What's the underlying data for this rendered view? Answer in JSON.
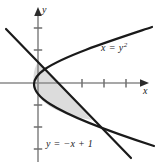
{
  "figure": {
    "background_color": "#ffffff",
    "width": 156,
    "height": 162
  },
  "axes": {
    "x_axis": {
      "label": "x",
      "color": "#7d7d7d",
      "origin_px": 38,
      "y_px": 83,
      "arrow": "right",
      "tick_spacing_px": 22,
      "ticks_right": 3,
      "tick_positions_px": [
        82,
        104,
        126
      ]
    },
    "y_axis": {
      "label": "y",
      "color": "#7d7d7d",
      "x_px": 38,
      "arrow": "up",
      "tick_spacing_px": 22,
      "tick_positions_px": [
        28,
        50,
        105,
        127,
        149
      ]
    }
  },
  "curves": [
    {
      "name": "parabola",
      "label": "x = y",
      "label_exponent": "2",
      "equation": "x = y^2",
      "color": "#1a1a1a",
      "stroke_width": 2.2
    },
    {
      "name": "line",
      "label": "y =  −x + 1",
      "equation": "y = -x + 1",
      "color": "#1a1a1a",
      "stroke_width": 2.2
    }
  ],
  "shaded_region": {
    "name": "bounded-region",
    "fill_color": "#dcdcdc",
    "description": "Region between the parabola x = y^2 and the line y = -x + 1"
  },
  "intersections": [
    {
      "name": "upper-intersection",
      "x_px": 38,
      "y_px": 62
    },
    {
      "name": "lower-intersection",
      "x_px": 92,
      "y_px": 120
    }
  ]
}
